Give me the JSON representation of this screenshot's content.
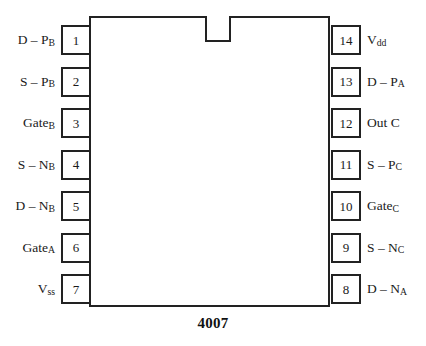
{
  "diagram": {
    "type": "ic-pinout",
    "part_number": "4007",
    "package": "14-pin DIP",
    "body": {
      "notch": "top-center-key-notch"
    },
    "pins": {
      "left": [
        {
          "number": "1",
          "name_main": "D – P",
          "name_sub": "B"
        },
        {
          "number": "2",
          "name_main": "S – P",
          "name_sub": "B"
        },
        {
          "number": "3",
          "name_main": "Gate",
          "name_sub": "B"
        },
        {
          "number": "4",
          "name_main": "S – N",
          "name_sub": "B"
        },
        {
          "number": "5",
          "name_main": "D – N",
          "name_sub": "B"
        },
        {
          "number": "6",
          "name_main": "Gate",
          "name_sub": "A"
        },
        {
          "number": "7",
          "name_main": "V",
          "name_sub": "ss"
        }
      ],
      "right": [
        {
          "number": "14",
          "name_main": "V",
          "name_sub": "dd"
        },
        {
          "number": "13",
          "name_main": "D – P",
          "name_sub": "A"
        },
        {
          "number": "12",
          "name_main": "Out C",
          "name_sub": ""
        },
        {
          "number": "11",
          "name_main": "S – P",
          "name_sub": "C"
        },
        {
          "number": "10",
          "name_main": "Gate",
          "name_sub": "C"
        },
        {
          "number": "9",
          "name_main": "S – N",
          "name_sub": "C"
        },
        {
          "number": "8",
          "name_main": "D – N",
          "name_sub": "A"
        }
      ]
    }
  },
  "colors": {
    "background": "#ffffff",
    "outline": "#222222",
    "text": "#1a1a1a"
  }
}
